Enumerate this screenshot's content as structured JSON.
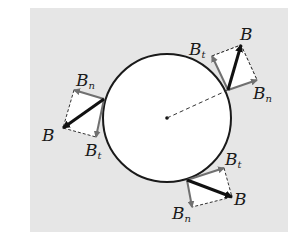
{
  "diagram": {
    "colors": {
      "background_panel": "#e6e6e6",
      "circle_fill": "#ffffff",
      "circle_stroke": "#1a1a1a",
      "B_vector": "#111111",
      "component_vector": "#707070",
      "dashed": "#333333"
    },
    "vectors": [
      {
        "id": "upper-right",
        "B": {
          "base": "B",
          "sub": ""
        },
        "Bt": {
          "base": "B",
          "sub": "t"
        },
        "Bn": {
          "base": "B",
          "sub": "n"
        }
      },
      {
        "id": "left",
        "B": {
          "base": "B",
          "sub": ""
        },
        "Bt": {
          "base": "B",
          "sub": "t"
        },
        "Bn": {
          "base": "B",
          "sub": "n"
        }
      },
      {
        "id": "bottom",
        "B": {
          "base": "B",
          "sub": ""
        },
        "Bt": {
          "base": "B",
          "sub": "t"
        },
        "Bn": {
          "base": "B",
          "sub": "n"
        }
      }
    ]
  }
}
